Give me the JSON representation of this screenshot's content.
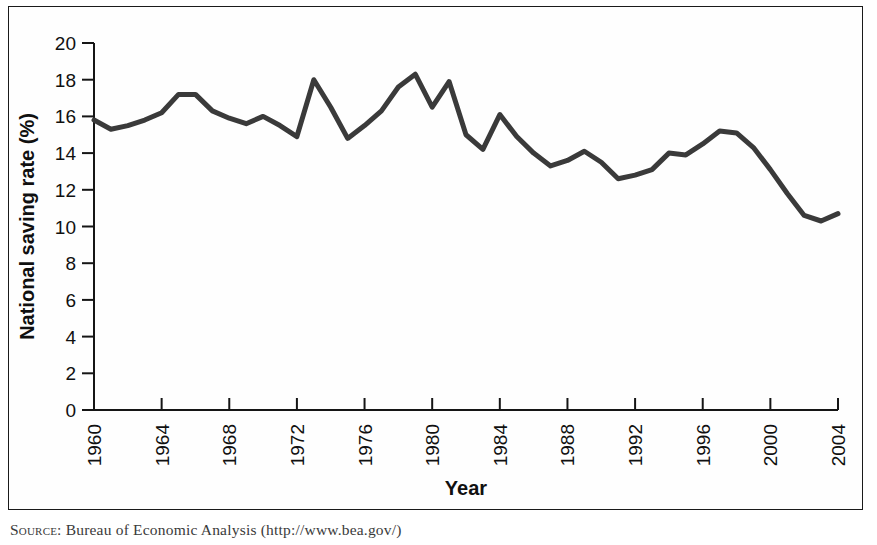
{
  "figure": {
    "source_prefix": "Source:",
    "source_text": " Bureau of Economic Analysis (http://www.bea.gov/)"
  },
  "chart_data": {
    "type": "line",
    "title": "",
    "xlabel": "Year",
    "ylabel": "National saving rate (%)",
    "xlim": [
      1960,
      2004
    ],
    "ylim": [
      0,
      20
    ],
    "xticks": [
      1960,
      1964,
      1968,
      1972,
      1976,
      1980,
      1984,
      1988,
      1992,
      1996,
      2000,
      2004
    ],
    "xtick_labels": [
      "1960",
      "1964",
      "1968",
      "1972",
      "1976",
      "1980",
      "1984",
      "1988",
      "1992",
      "1996",
      "2000",
      "2004"
    ],
    "yticks": [
      0,
      2,
      4,
      6,
      8,
      10,
      12,
      14,
      16,
      18,
      20
    ],
    "ytick_labels": [
      "0",
      "2",
      "4",
      "6",
      "8",
      "10",
      "12",
      "14",
      "16",
      "18",
      "20"
    ],
    "grid": false,
    "legend": false,
    "line_color": "#3a3a3a",
    "line_width": 5,
    "x": [
      1960,
      1961,
      1962,
      1963,
      1964,
      1965,
      1966,
      1967,
      1968,
      1969,
      1970,
      1971,
      1972,
      1973,
      1974,
      1975,
      1976,
      1977,
      1978,
      1979,
      1980,
      1981,
      1982,
      1983,
      1984,
      1985,
      1986,
      1987,
      1988,
      1989,
      1990,
      1991,
      1992,
      1993,
      1994,
      1995,
      1996,
      1997,
      1998,
      1999,
      2000,
      2001,
      2002,
      2003,
      2004
    ],
    "y": [
      15.8,
      15.3,
      15.5,
      15.8,
      16.2,
      17.2,
      17.2,
      16.3,
      15.9,
      15.6,
      16.0,
      15.5,
      14.9,
      18.0,
      16.5,
      14.8,
      15.5,
      16.3,
      17.6,
      18.3,
      16.5,
      17.9,
      15.0,
      14.2,
      16.1,
      14.9,
      14.0,
      13.3,
      13.6,
      14.1,
      13.5,
      12.6,
      12.8,
      13.1,
      14.0,
      13.9,
      14.5,
      15.2,
      15.1,
      14.3,
      13.1,
      11.8,
      10.6,
      10.3,
      10.7
    ],
    "series_name": "National saving rate"
  }
}
